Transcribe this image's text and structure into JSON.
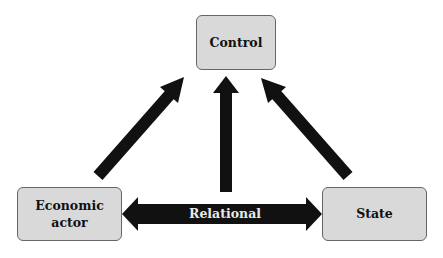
{
  "diagram": {
    "nodes": {
      "control": {
        "label": "Control"
      },
      "economic_actor": {
        "label_line1": "Economic",
        "label_line2": "actor"
      },
      "state": {
        "label": "State"
      }
    },
    "edges": {
      "relational": {
        "label": "Relational",
        "type": "bidirectional",
        "from": "Economic actor",
        "to": "State"
      },
      "economic_to_control": {
        "from": "Economic actor",
        "to": "Control"
      },
      "relational_to_control": {
        "from": "Relational",
        "to": "Control"
      },
      "state_to_control": {
        "from": "State",
        "to": "Control"
      }
    },
    "colors": {
      "box_fill": "#d9d9d9",
      "box_border": "#666666",
      "arrow": "#111111",
      "relational_text": "#e8e8e8"
    }
  }
}
